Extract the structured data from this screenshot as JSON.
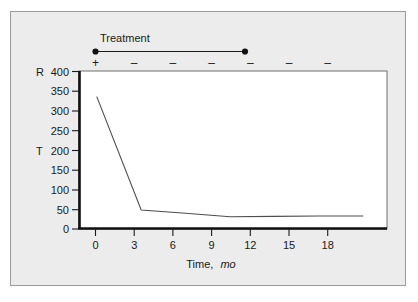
{
  "figure": {
    "background_color": "#ececec",
    "border_color": "#9a9a9a",
    "plot_background_color": "#ffffff"
  },
  "annotation": {
    "treatment_label": "Treatment",
    "treatment_bar_start_month": 0,
    "treatment_bar_end_month": 11.6,
    "signs": [
      {
        "month": 0,
        "symbol": "+"
      },
      {
        "month": 3,
        "symbol": "–"
      },
      {
        "month": 6,
        "symbol": "–"
      },
      {
        "month": 9,
        "symbol": "–"
      },
      {
        "month": 12,
        "symbol": "–"
      },
      {
        "month": 15,
        "symbol": "–"
      },
      {
        "month": 18,
        "symbol": "–"
      }
    ]
  },
  "y_axis_letters": [
    {
      "label": "R",
      "value": 400
    },
    {
      "label": "T",
      "value": 200
    }
  ],
  "chart_data": {
    "type": "line",
    "title": "",
    "xlabel": "Time, mo",
    "xlabel_main": "Time,",
    "xlabel_unit": "mo",
    "ylabel": "",
    "x": [
      0,
      3,
      6,
      9,
      12,
      15,
      18
    ],
    "xticks": [
      0,
      3,
      6,
      9,
      12,
      15,
      18
    ],
    "xticklabels": [
      "0",
      "3",
      "6",
      "9",
      "12",
      "15",
      "18"
    ],
    "xlim": [
      -1.2,
      19.6
    ],
    "yticks": [
      0,
      50,
      100,
      150,
      200,
      250,
      300,
      350,
      400
    ],
    "yticklabels": [
      "0",
      "50",
      "100",
      "150",
      "200",
      "250",
      "300",
      "350",
      "400"
    ],
    "ylim": [
      0,
      400
    ],
    "grid": false,
    "legend": false,
    "series": [
      {
        "name": "",
        "color": "#4d4d4d",
        "values": [
          335,
          48,
          40,
          31,
          32,
          33,
          33
        ]
      }
    ]
  }
}
